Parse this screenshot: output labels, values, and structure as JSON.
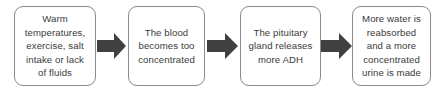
{
  "diagram": {
    "type": "flowchart",
    "orientation": "left-to-right",
    "title": "",
    "colors": {
      "background": "#ffffff",
      "node_border": "#8a8a8a",
      "node_fill": "#ffffff",
      "text": "#3a3a3a",
      "arrow": "#404040"
    },
    "nodes": [
      {
        "id": "node-1",
        "label": "Warm\ntemperatures,\nexercise, salt\nintake or lack\nof fluids"
      },
      {
        "id": "node-2",
        "label": "The blood\nbecomes too\nconcentrated"
      },
      {
        "id": "node-3",
        "label": "The pituitary\ngland releases\nmore ADH"
      },
      {
        "id": "node-4",
        "label": "More water is\nreabsorbed\nand a more\nconcentrated\nurine is made"
      }
    ],
    "connectors": [
      {
        "id": "arrow-1",
        "from": "node-1",
        "to": "node-2",
        "shape": "block-arrow-right"
      },
      {
        "id": "arrow-2",
        "from": "node-2",
        "to": "node-3",
        "shape": "block-arrow-right"
      },
      {
        "id": "arrow-3",
        "from": "node-3",
        "to": "node-4",
        "shape": "block-arrow-right"
      }
    ]
  }
}
